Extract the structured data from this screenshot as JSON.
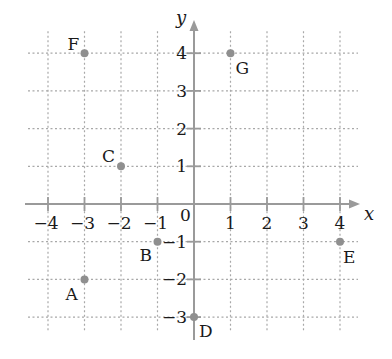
{
  "chart_data": {
    "type": "scatter",
    "title": "",
    "xlabel": "x",
    "ylabel": "y",
    "xlim": [
      -4,
      4
    ],
    "ylim": [
      -3,
      4
    ],
    "grid": true,
    "grid_style": "dotted",
    "origin_label": "0",
    "x_ticks": [
      -4,
      -3,
      -2,
      -1,
      1,
      2,
      3,
      4
    ],
    "x_tick_labels": [
      "−4",
      "−3",
      "−2",
      "−1",
      "1",
      "2",
      "3",
      "4"
    ],
    "y_ticks": [
      4,
      3,
      2,
      1,
      -1,
      -2,
      -3
    ],
    "y_tick_labels": [
      "4",
      "3",
      "2",
      "1",
      "−1",
      "−2",
      "−3"
    ],
    "points": [
      {
        "label": "A",
        "x": -3,
        "y": -2
      },
      {
        "label": "B",
        "x": -1,
        "y": -1
      },
      {
        "label": "C",
        "x": -2,
        "y": 1
      },
      {
        "label": "D",
        "x": 0,
        "y": -3
      },
      {
        "label": "E",
        "x": 4,
        "y": -1
      },
      {
        "label": "F",
        "x": -3,
        "y": 4
      },
      {
        "label": "G",
        "x": 1,
        "y": 4
      }
    ],
    "colors": {
      "axis": "#9a9a9a",
      "grid": "#a8a8a8",
      "point": "#8f8f8f",
      "text": "#1a1a1a"
    }
  }
}
